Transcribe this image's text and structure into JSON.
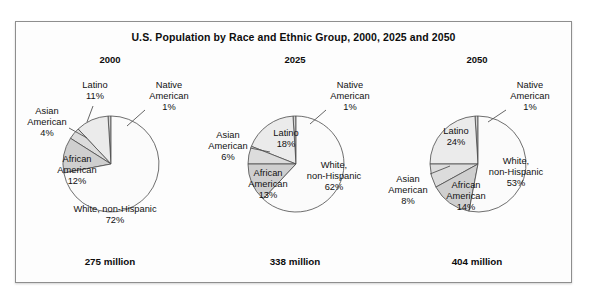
{
  "figure": {
    "title": "U.S. Population by Race and Ethnic Group, 2000, 2025 and 2050"
  },
  "chart_data": {
    "type": "pie",
    "title": "U.S. Population by Race and Ethnic Group, 2000, 2025 and 2050",
    "legend_position": "none",
    "grid": false,
    "categories": [
      "Native American",
      "Latino",
      "Asian American",
      "African American",
      "White, non-Hispanic"
    ],
    "panels": [
      {
        "year": "2000",
        "total": "275 million",
        "slices": [
          {
            "name": "Native American",
            "label": "Native\nAmerican",
            "value": 1,
            "percent": "1%",
            "color": "#d4d4d4"
          },
          {
            "name": "Latino",
            "label": "Latino",
            "value": 11,
            "percent": "11%",
            "color": "#ebebeb"
          },
          {
            "name": "Asian American",
            "label": "Asian\nAmerican",
            "value": 4,
            "percent": "4%",
            "color": "#dcdcdc"
          },
          {
            "name": "African American",
            "label": "African\nAmerican",
            "value": 12,
            "percent": "12%",
            "color": "#cfcfcf"
          },
          {
            "name": "White, non-Hispanic",
            "label": "White, non-Hispanic",
            "value": 72,
            "percent": "72%",
            "color": "#fbfbfb"
          }
        ]
      },
      {
        "year": "2025",
        "total": "338 million",
        "slices": [
          {
            "name": "Native American",
            "label": "Native\nAmerican",
            "value": 1,
            "percent": "1%",
            "color": "#d4d4d4"
          },
          {
            "name": "Latino",
            "label": "Latino",
            "value": 18,
            "percent": "18%",
            "color": "#ebebeb"
          },
          {
            "name": "Asian American",
            "label": "Asian\nAmerican",
            "value": 6,
            "percent": "6%",
            "color": "#dcdcdc"
          },
          {
            "name": "African American",
            "label": "African\nAmerican",
            "value": 13,
            "percent": "13%",
            "color": "#cfcfcf"
          },
          {
            "name": "White, non-Hispanic",
            "label": "White,\nnon-Hispanic",
            "value": 62,
            "percent": "62%",
            "color": "#fbfbfb"
          }
        ]
      },
      {
        "year": "2050",
        "total": "404 million",
        "slices": [
          {
            "name": "Native American",
            "label": "Native\nAmerican",
            "value": 1,
            "percent": "1%",
            "color": "#d4d4d4"
          },
          {
            "name": "Latino",
            "label": "Latino",
            "value": 24,
            "percent": "24%",
            "color": "#ebebeb"
          },
          {
            "name": "Asian American",
            "label": "Asian\nAmerican",
            "value": 8,
            "percent": "8%",
            "color": "#dcdcdc"
          },
          {
            "name": "African American",
            "label": "African\nAmerican",
            "value": 14,
            "percent": "14%",
            "color": "#cfcfcf"
          },
          {
            "name": "White, non-Hispanic",
            "label": "White,\nnon-Hispanic",
            "value": 53,
            "percent": "53%",
            "color": "#fbfbfb"
          }
        ]
      }
    ],
    "label_layout": [
      {
        "Native American": {
          "x": 152,
          "y": 22,
          "anchor": "middle",
          "leader": [
            128,
            44,
            110,
            60
          ]
        },
        "Latino": {
          "x": 78,
          "y": 22,
          "anchor": "middle",
          "leader": [
            76,
            40,
            70,
            56
          ]
        },
        "Asian American": {
          "x": 30,
          "y": 48,
          "anchor": "middle",
          "leader": [
            52,
            62,
            70,
            72
          ]
        },
        "African American": {
          "x": 60,
          "y": 96,
          "anchor": "middle",
          "leader": null
        },
        "White, non-Hispanic": {
          "x": 98,
          "y": 146,
          "anchor": "middle",
          "leader": null
        }
      },
      {
        "Native American": {
          "x": 148,
          "y": 22,
          "anchor": "middle",
          "leader": [
            124,
            44,
            108,
            58
          ]
        },
        "Latino": {
          "x": 84,
          "y": 70,
          "anchor": "middle",
          "leader": null
        },
        "Asian American": {
          "x": 26,
          "y": 72,
          "anchor": "middle",
          "leader": [
            48,
            82,
            68,
            86
          ]
        },
        "African American": {
          "x": 66,
          "y": 110,
          "anchor": "middle",
          "leader": null
        },
        "White, non-Hispanic": {
          "x": 132,
          "y": 102,
          "anchor": "middle",
          "leader": null
        }
      },
      {
        "Native American": {
          "x": 146,
          "y": 22,
          "anchor": "middle",
          "leader": [
            122,
            44,
            104,
            56
          ]
        },
        "Latino": {
          "x": 72,
          "y": 68,
          "anchor": "middle",
          "leader": null
        },
        "Asian American": {
          "x": 24,
          "y": 116,
          "anchor": "middle",
          "leader": [
            46,
            108,
            66,
            100
          ]
        },
        "African American": {
          "x": 82,
          "y": 122,
          "anchor": "middle",
          "leader": null
        },
        "White, non-Hispanic": {
          "x": 132,
          "y": 98,
          "anchor": "middle",
          "leader": null
        }
      }
    ]
  }
}
